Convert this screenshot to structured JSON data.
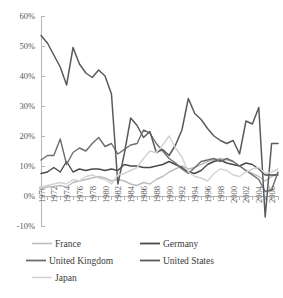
{
  "chart_data": {
    "type": "line",
    "title": "",
    "subtitle": "",
    "xlabel": "",
    "ylabel": "",
    "grid": false,
    "legend_position": "bottom",
    "xlim": [
      1970,
      2007
    ],
    "ylim": [
      -10,
      60
    ],
    "ytick_labels": [
      "60%",
      "50%",
      "40%",
      "30%",
      "20%",
      "10%",
      "0%",
      "-10%"
    ],
    "ytick_values": [
      60,
      50,
      40,
      30,
      20,
      10,
      0,
      -10
    ],
    "xtick_labels": [
      "1970",
      "1972",
      "1974",
      "1976",
      "1978",
      "1980",
      "1982",
      "1984",
      "1986",
      "1988",
      "1990",
      "1992",
      "1994",
      "1996",
      "1998",
      "2000",
      "2002",
      "2004",
      "2006"
    ],
    "xtick_values": [
      1970,
      1972,
      1974,
      1976,
      1978,
      1980,
      1982,
      1984,
      1986,
      1988,
      1990,
      1992,
      1994,
      1996,
      1998,
      2000,
      2002,
      2004,
      2006
    ],
    "x": [
      1970,
      1971,
      1972,
      1973,
      1974,
      1975,
      1976,
      1977,
      1978,
      1979,
      1980,
      1981,
      1982,
      1983,
      1984,
      1985,
      1986,
      1987,
      1988,
      1989,
      1990,
      1991,
      1992,
      1993,
      1994,
      1995,
      1996,
      1997,
      1998,
      1999,
      2000,
      2001,
      2002,
      2003,
      2004,
      2005,
      2006,
      2007
    ],
    "series": [
      {
        "name": "France",
        "color": "#bcbcbc",
        "width": 1.4,
        "values": [
          2.5,
          3.0,
          3.2,
          3.5,
          3.0,
          4.5,
          5.0,
          5.5,
          6.0,
          6.5,
          6.0,
          5.0,
          5.5,
          5.0,
          4.0,
          3.5,
          4.5,
          4.0,
          5.5,
          6.5,
          8.0,
          9.0,
          10.0,
          9.0,
          9.5,
          10.5,
          11.5,
          12.0,
          12.5,
          12.0,
          11.5,
          10.0,
          8.5,
          7.5,
          6.5,
          5.0,
          6.5,
          7.5
        ]
      },
      {
        "name": "Germany",
        "color": "#4a4a4a",
        "width": 1.4,
        "values": [
          7.5,
          8.0,
          9.5,
          8.0,
          11.5,
          8.0,
          9.0,
          8.5,
          9.0,
          9.0,
          8.5,
          9.0,
          8.5,
          10.5,
          10.0,
          10.0,
          9.5,
          9.5,
          10.0,
          10.5,
          11.5,
          10.5,
          9.5,
          8.0,
          7.5,
          8.5,
          10.5,
          11.5,
          12.0,
          11.0,
          10.5,
          10.0,
          11.0,
          10.5,
          9.0,
          7.0,
          7.0,
          7.0
        ]
      },
      {
        "name": "United Kingdom",
        "color": "#6d6d6d",
        "width": 1.4,
        "values": [
          12.0,
          13.5,
          13.5,
          19.0,
          10.5,
          14.5,
          16.0,
          15.0,
          17.5,
          19.5,
          16.5,
          17.5,
          14.0,
          15.5,
          17.0,
          17.5,
          22.0,
          21.0,
          17.5,
          15.0,
          12.5,
          11.0,
          9.0,
          7.5,
          9.5,
          11.5,
          12.0,
          12.5,
          11.5,
          12.5,
          11.5,
          10.0,
          8.5,
          7.0,
          5.5,
          1.5,
          2.0,
          8.0
        ]
      },
      {
        "name": "United States",
        "color": "#5a5a5a",
        "width": 1.5,
        "values": [
          53.5,
          51.0,
          47.0,
          43.0,
          37.0,
          49.5,
          44.0,
          41.0,
          39.5,
          42.0,
          40.0,
          34.0,
          4.0,
          14.0,
          26.0,
          23.5,
          19.5,
          21.5,
          14.5,
          15.5,
          13.5,
          17.0,
          22.0,
          32.5,
          27.5,
          25.5,
          22.5,
          20.0,
          18.5,
          17.5,
          18.5,
          14.0,
          25.0,
          24.0,
          29.5,
          -7.0,
          17.5,
          17.5
        ]
      },
      {
        "name": "Japan",
        "color": "#d2d2d2",
        "width": 1.4,
        "values": [
          3.0,
          3.5,
          4.0,
          4.5,
          4.0,
          5.5,
          5.0,
          6.5,
          7.0,
          6.0,
          5.5,
          4.0,
          7.0,
          7.5,
          8.5,
          9.5,
          12.5,
          15.0,
          14.5,
          17.0,
          20.0,
          16.0,
          13.0,
          8.0,
          6.5,
          6.0,
          5.0,
          7.5,
          9.0,
          8.5,
          7.0,
          6.5,
          8.0,
          9.0,
          9.5,
          7.5,
          8.0,
          9.0
        ]
      }
    ],
    "legend": [
      {
        "label": "France",
        "color": "#bcbcbc",
        "width": 1.5
      },
      {
        "label": "Germany",
        "color": "#4a4a4a",
        "width": 1.8
      },
      {
        "label": "United Kingdom",
        "color": "#6d6d6d",
        "width": 1.8
      },
      {
        "label": "United States",
        "color": "#5a5a5a",
        "width": 1.8
      },
      {
        "label": "Japan",
        "color": "#d2d2d2",
        "width": 1.5
      }
    ]
  }
}
